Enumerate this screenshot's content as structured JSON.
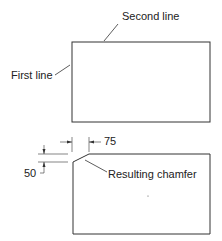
{
  "diagram": {
    "top_figure": {
      "labels": {
        "second_line": "Second line",
        "first_line": "First line"
      }
    },
    "bottom_figure": {
      "labels": {
        "dim_horizontal": "75",
        "dim_vertical": "50",
        "chamfer": "Resulting chamfer"
      }
    },
    "colors": {
      "stroke": "#333333",
      "background": "#ffffff"
    }
  }
}
